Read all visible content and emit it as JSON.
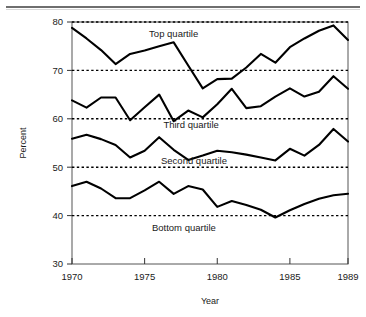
{
  "figure": {
    "background_color": "#ffffff",
    "line_color": "#000000",
    "grid_color": "#000000",
    "frame_color": "#555555",
    "rule_color": "#6f6f6f"
  },
  "chart_data": {
    "type": "line",
    "title": "",
    "subtitle": "",
    "xlabel": "Year",
    "ylabel": "Percent",
    "xlim": [
      1970,
      1989
    ],
    "ylim": [
      30,
      80
    ],
    "ytick_labels": [
      "80",
      "70",
      "60",
      "50",
      "40",
      "30"
    ],
    "yticks": [
      80,
      70,
      60,
      50,
      40,
      30
    ],
    "xtick_labels": [
      "1970",
      "1975",
      "1980",
      "1985",
      "1989"
    ],
    "xticks": [
      1970,
      1975,
      1980,
      1985,
      1989
    ],
    "grid": "horizontal dashed gridlines at 80, 70, 60, 50, 40",
    "grid_values": [
      80,
      70,
      60,
      50,
      40
    ],
    "legend_position": "inline annotations below each series",
    "x": [
      1970,
      1971,
      1972,
      1973,
      1974,
      1975,
      1976,
      1977,
      1978,
      1979,
      1980,
      1981,
      1982,
      1983,
      1984,
      1985,
      1986,
      1987,
      1988,
      1989
    ],
    "series": [
      {
        "name": "Top quartile",
        "annotation": "Top quartile",
        "annotation_x": 1977.0,
        "annotation_y": 77.0,
        "values": [
          78.8,
          76.6,
          74.2,
          71.3,
          73.4,
          74.1,
          75.0,
          75.8,
          71.0,
          66.3,
          68.2,
          68.3,
          70.6,
          73.4,
          71.6,
          74.8,
          76.6,
          78.2,
          79.3,
          76.3
        ]
      },
      {
        "name": "Third quartile",
        "annotation": "Third quartile",
        "annotation_x": 1978.2,
        "annotation_y": 58.1,
        "values": [
          63.8,
          62.3,
          64.4,
          64.4,
          59.7,
          62.4,
          65.0,
          59.5,
          61.7,
          60.3,
          63.0,
          66.2,
          62.2,
          62.6,
          64.6,
          66.3,
          64.6,
          65.6,
          68.8,
          66.2
        ]
      },
      {
        "name": "Second quartile",
        "annotation": "Second quartile",
        "annotation_x": 1978.4,
        "annotation_y": 50.6,
        "values": [
          55.9,
          56.7,
          55.8,
          54.6,
          52.0,
          53.4,
          56.2,
          53.6,
          51.5,
          52.4,
          53.4,
          53.1,
          52.6,
          52.0,
          51.4,
          53.8,
          52.4,
          54.6,
          57.9,
          55.3
        ]
      },
      {
        "name": "Bottom quartile",
        "annotation": "Bottom quartile",
        "annotation_x": 1977.7,
        "annotation_y": 36.8,
        "values": [
          46.1,
          47.0,
          45.6,
          43.6,
          43.6,
          45.2,
          47.0,
          44.5,
          46.1,
          45.4,
          41.8,
          43.0,
          42.2,
          41.2,
          39.6,
          41.1,
          42.4,
          43.5,
          44.2,
          44.5
        ]
      }
    ]
  }
}
